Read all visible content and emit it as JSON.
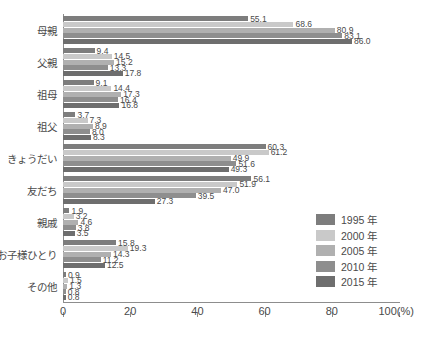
{
  "chart_data": {
    "type": "bar",
    "orientation": "horizontal",
    "title": "",
    "xlabel": "",
    "ylabel": "",
    "xlim": [
      0,
      100
    ],
    "xticks": [
      0,
      20,
      40,
      60,
      80,
      100
    ],
    "xtick_labels": [
      "0",
      "20",
      "40",
      "60",
      "80",
      "100(%)"
    ],
    "unit_suffix": "(%)",
    "grid": false,
    "legend_position": "right-bottom",
    "categories": [
      "母親",
      "父親",
      "祖母",
      "祖父",
      "きょうだい",
      "友だち",
      "親戚",
      "お子様ひとり",
      "その他"
    ],
    "series": [
      {
        "name": "1995 年",
        "color": "#7d7d7d",
        "values": [
          55.1,
          9.4,
          9.1,
          3.7,
          60.3,
          56.1,
          1.9,
          15.8,
          0.9
        ],
        "labels": [
          "55.1",
          "9.4",
          "9.1",
          "3.7",
          "60.3",
          "56.1",
          "1.9",
          "15.8",
          "0.9"
        ]
      },
      {
        "name": "2000 年",
        "color": "#c9c9c9",
        "values": [
          68.6,
          14.5,
          14.4,
          7.3,
          61.2,
          51.9,
          3.2,
          19.3,
          1.5
        ],
        "labels": [
          "68.6",
          "14.5",
          "14.4",
          "7.3",
          "61.2",
          "51.9",
          "3.2",
          "19.3",
          "1.5"
        ]
      },
      {
        "name": "2005 年",
        "color": "#b0b0b0",
        "values": [
          80.9,
          15.2,
          17.3,
          8.9,
          49.9,
          47.0,
          4.6,
          14.3,
          1.3
        ],
        "labels": [
          "80.9",
          "15.2",
          "17.3",
          "8.9",
          "49.9",
          "47.0",
          "4.6",
          "14.3",
          "1.3"
        ]
      },
      {
        "name": "2010 年",
        "color": "#8e8e8e",
        "values": [
          83.1,
          13.3,
          16.4,
          8.0,
          51.6,
          39.5,
          3.8,
          11.2,
          0.8
        ],
        "labels": [
          "83.1",
          "13.3",
          "16.4",
          "8.0",
          "51.6",
          "39.5",
          "3.8",
          "11.2",
          "0.8"
        ]
      },
      {
        "name": "2015 年",
        "color": "#6e6e6e",
        "values": [
          86.0,
          17.8,
          16.8,
          8.3,
          49.3,
          27.3,
          3.5,
          12.5,
          0.8
        ],
        "labels": [
          "86.0",
          "17.8",
          "16.8",
          "8.3",
          "49.3",
          "27.3",
          "3.5",
          "12.5",
          "0.8"
        ]
      }
    ]
  },
  "legend": {
    "items": [
      {
        "label": "1995 年",
        "color": "#7d7d7d"
      },
      {
        "label": "2000 年",
        "color": "#c9c9c9"
      },
      {
        "label": "2005 年",
        "color": "#b0b0b0"
      },
      {
        "label": "2010 年",
        "color": "#8e8e8e"
      },
      {
        "label": "2015 年",
        "color": "#6e6e6e"
      }
    ]
  }
}
